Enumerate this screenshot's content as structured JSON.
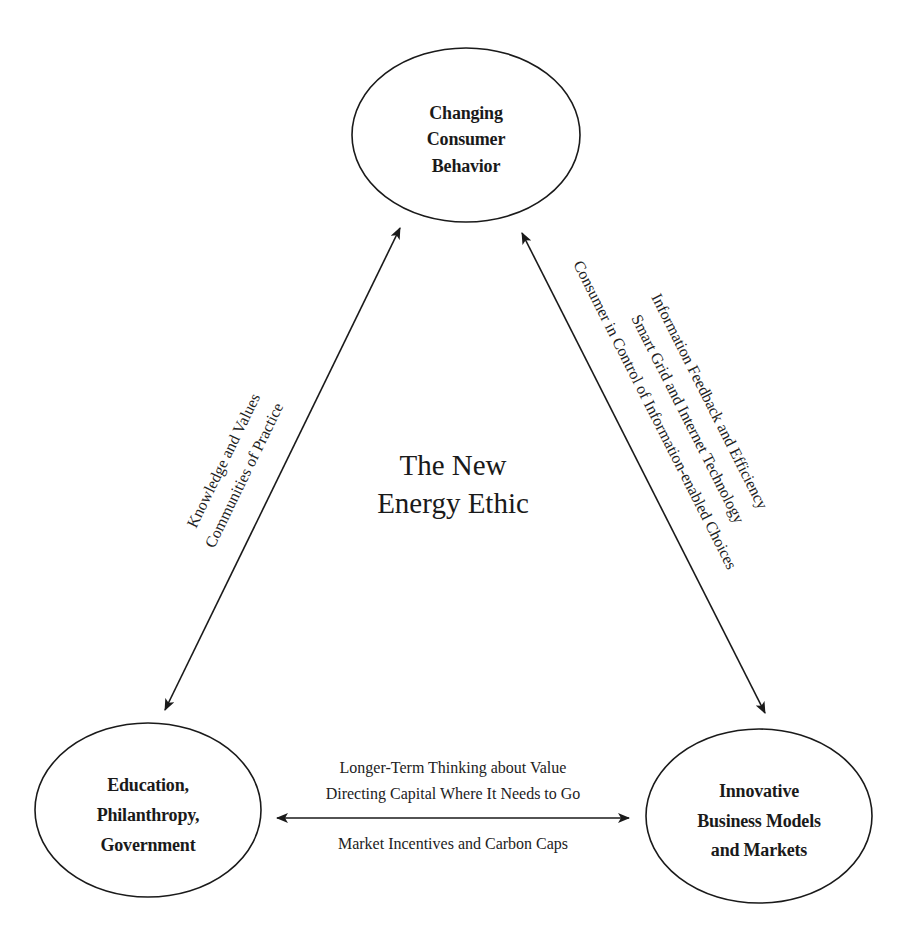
{
  "diagram": {
    "center_label": {
      "line1": "The New",
      "line2": "Energy Ethic"
    },
    "nodes": {
      "top": {
        "lines": [
          "Changing",
          "Consumer",
          "Behavior"
        ]
      },
      "bottom_left": {
        "lines": [
          "Education,",
          "Philanthropy,",
          "Government"
        ]
      },
      "bottom_right": {
        "lines": [
          "Innovative",
          "Business Models",
          "and Markets"
        ]
      }
    },
    "edges": {
      "left": {
        "from": "bottom_left",
        "to": "top",
        "bidirectional": true,
        "labels": [
          "Knowledge and Values",
          "Communities of Practice"
        ]
      },
      "right": {
        "from": "top",
        "to": "bottom_right",
        "bidirectional": true,
        "labels": [
          "Information Feedback and Efficiency",
          "Smart Grid and Internet Technology",
          "Consumer in Control of Information-enabled Choices"
        ]
      },
      "bottom": {
        "from": "bottom_left",
        "to": "bottom_right",
        "bidirectional": true,
        "labels_above": [
          "Longer-Term Thinking about Value",
          "Directing Capital Where It Needs to Go"
        ],
        "labels_below": [
          "Market Incentives and Carbon Caps"
        ]
      }
    },
    "colors": {
      "ink": "#1a1a1a",
      "background": "#ffffff"
    }
  }
}
